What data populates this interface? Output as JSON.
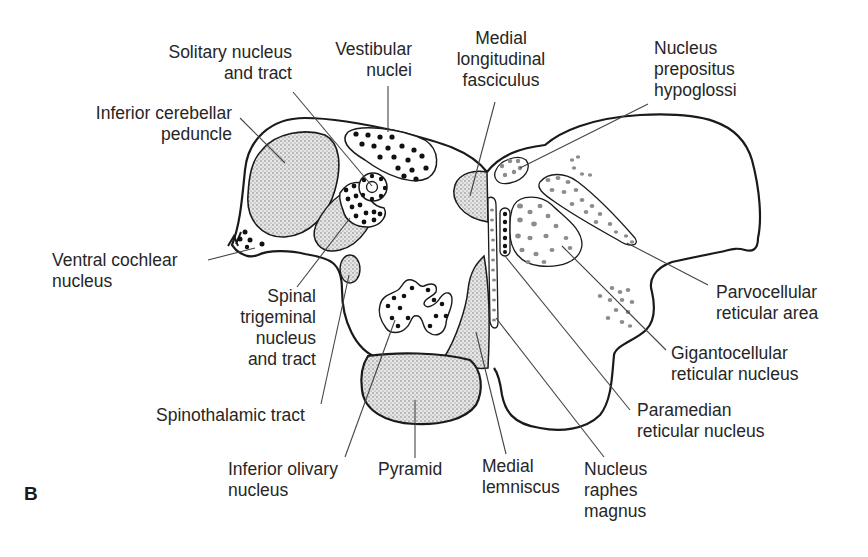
{
  "figure": {
    "panel_label": "B",
    "colors": {
      "outline": "#1a1a1a",
      "stipple_fill": "#d9d9d9",
      "black_dots": "#111111",
      "gray_dots": "#8c8c8c",
      "leader_lines": "#444444",
      "background": "#ffffff"
    }
  },
  "labels": {
    "solitary": "Solitary nucleus\nand tract",
    "vestibular": "Vestibular\nnuclei",
    "mlf": "Medial\nlongitudinal\nfasciculus",
    "prepositus": "Nucleus\nprepositus\nhypoglossi",
    "icp": "Inferior cerebellar\npeduncle",
    "ventral_cochlear": "Ventral cochlear\nnucleus",
    "spinal_trigeminal": "Spinal\ntrigeminal\nnucleus\nand tract",
    "spinothalamic": "Spinothalamic tract",
    "inferior_olivary": "Inferior olivary\nnucleus",
    "pyramid": "Pyramid",
    "medial_lemniscus": "Medial\nlemniscus",
    "raphe_magnus": "Nucleus\nraphes\nmagnus",
    "paramedian": "Paramedian\nreticular nucleus",
    "gigantocellular": "Gigantocellular\nreticular nucleus",
    "parvocellular": "Parvocellular\nreticular area"
  }
}
